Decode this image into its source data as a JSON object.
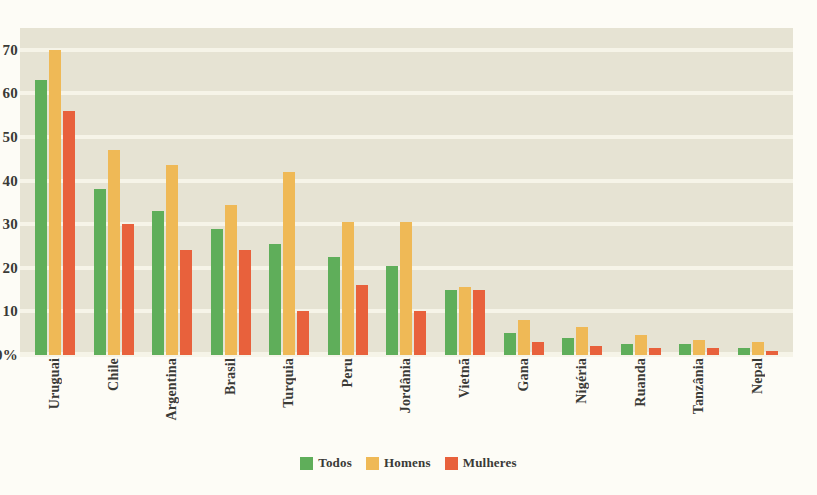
{
  "chart_data": {
    "type": "bar",
    "title": "",
    "xlabel": "",
    "ylabel": "",
    "ylim": [
      0,
      75
    ],
    "yticks": [
      "0%",
      "10",
      "20",
      "30",
      "40",
      "50",
      "60",
      "70"
    ],
    "ytick_values": [
      0,
      10,
      20,
      30,
      40,
      50,
      60,
      70
    ],
    "grid": true,
    "legend_position": "bottom",
    "categories": [
      "Uruguai",
      "Chile",
      "Argentina",
      "Brasil",
      "Turquia",
      "Peru",
      "Jordânia",
      "Vietnã",
      "Gana",
      "Nigéria",
      "Ruanda",
      "Tanzânia",
      "Nepal"
    ],
    "series": [
      {
        "name": "Todos",
        "color": "#5FAE5A",
        "values": [
          63,
          38,
          33,
          29,
          25.5,
          22.5,
          20.5,
          15,
          5,
          4,
          2.5,
          2.5,
          1.5
        ]
      },
      {
        "name": "Homens",
        "color": "#EFB956",
        "values": [
          70,
          47,
          43.5,
          34.5,
          42,
          30.5,
          30.5,
          15.5,
          8,
          6.5,
          4.5,
          3.5,
          3
        ]
      },
      {
        "name": "Mulheres",
        "color": "#E8613C",
        "values": [
          56,
          30,
          24,
          24,
          10,
          16,
          10,
          15,
          3,
          2,
          1.5,
          1.5,
          1
        ]
      }
    ]
  },
  "colors": {
    "plot_background": "#E6E3D3",
    "page_background": "#FDFCF6",
    "gridline": "#F6F4E8",
    "text": "#3A3A36",
    "todos": "#5FAE5A",
    "homens": "#EFB956",
    "mulheres": "#E8613C"
  }
}
